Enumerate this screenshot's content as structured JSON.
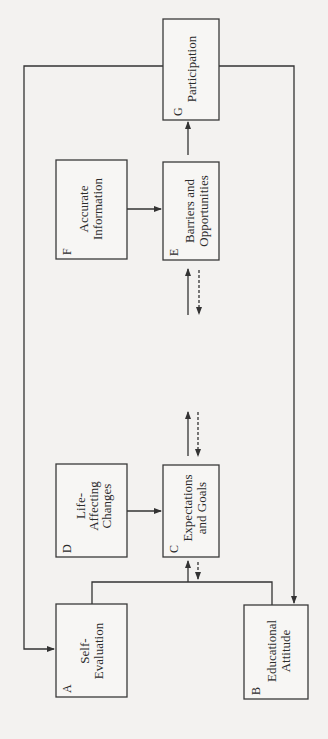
{
  "diagram": {
    "title": "",
    "orientation": "rotated-90-ccw",
    "colors": {
      "background": "#f3f2f0",
      "stroke": "#333333",
      "text": "#2c2c2c"
    },
    "nodes": [
      {
        "id": "A",
        "letter": "A",
        "lines": [
          "Self-",
          "Evaluation"
        ]
      },
      {
        "id": "B",
        "letter": "B",
        "lines": [
          "Educational",
          "Attitude"
        ]
      },
      {
        "id": "C",
        "letter": "C",
        "lines": [
          "Expectations",
          "and Goals"
        ]
      },
      {
        "id": "D",
        "letter": "D",
        "lines": [
          "Life-",
          "Affecting",
          "Changes"
        ]
      },
      {
        "id": "E",
        "letter": "E",
        "lines": [
          "Barriers and",
          "Opportunities"
        ]
      },
      {
        "id": "F",
        "letter": "F",
        "lines": [
          "Accurate",
          "Information"
        ]
      },
      {
        "id": "G",
        "letter": "G",
        "lines": [
          "Participation"
        ]
      }
    ],
    "edges": [
      {
        "from": "A",
        "to": "C",
        "style": "solid",
        "note": "A and B jointly feed C"
      },
      {
        "from": "B",
        "to": "C",
        "style": "solid"
      },
      {
        "from": "C",
        "to": "A+B",
        "style": "dashed"
      },
      {
        "from": "D",
        "to": "C",
        "style": "solid"
      },
      {
        "from": "C",
        "to": "E",
        "style": "solid"
      },
      {
        "from": "E",
        "to": "C",
        "style": "dashed"
      },
      {
        "from": "F",
        "to": "E",
        "style": "solid"
      },
      {
        "from": "E",
        "to": "G",
        "style": "solid"
      },
      {
        "from": "G",
        "to": "A",
        "style": "solid"
      },
      {
        "from": "G",
        "to": "B",
        "style": "solid"
      }
    ]
  }
}
